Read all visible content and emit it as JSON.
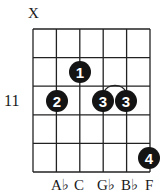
{
  "diagram": {
    "type": "guitar-chord-chart",
    "muted_marker": "X",
    "fret_label": "11",
    "strings": 6,
    "frets_shown": 5,
    "fingers": [
      {
        "finger": "1",
        "string": 3,
        "fret_row": 2
      },
      {
        "finger": "2",
        "string": 2,
        "fret_row": 3
      },
      {
        "finger": "3",
        "string": 4,
        "fret_row": 3
      },
      {
        "finger": "3",
        "string": 5,
        "fret_row": 3
      },
      {
        "finger": "4",
        "string": 6,
        "fret_row": 5
      }
    ],
    "barre_arc": "strings 4-5, fret row 3",
    "note_labels": [
      "",
      "A♭",
      "C",
      "G♭",
      "B♭",
      "F"
    ]
  }
}
